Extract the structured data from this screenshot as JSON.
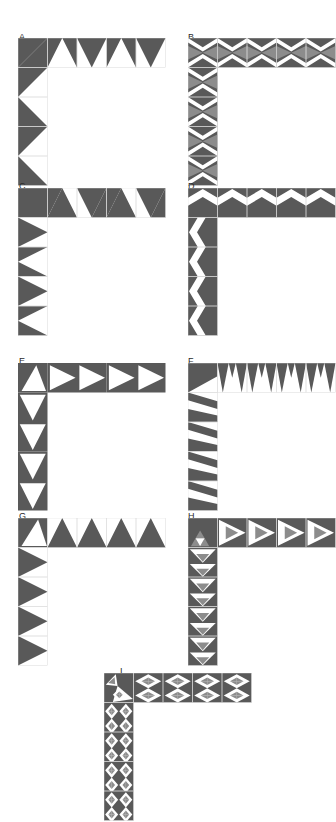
{
  "figure": {
    "type": "geometric-tiling-grid",
    "background_color": "#ffffff",
    "colors": {
      "dark": "#595959",
      "mid": "#8c8c8c",
      "white": "#ffffff",
      "grid_line": "#d9d9d9",
      "cell_line": "#595959",
      "label": "#2b2b2b"
    },
    "cell_size": 29.5,
    "shape": {
      "name": "L-elbow",
      "arm_horizontal_cells": 5,
      "arm_vertical_cells": 5,
      "thickness_cells": 1
    }
  },
  "panels": [
    {
      "id": "A",
      "label": "A",
      "label_x": 19,
      "label_y": 33,
      "art_x": 18,
      "art_y": 38,
      "cols": 5,
      "rows": 5,
      "cell": 29.5,
      "pattern": "half-square-triangles-alternating",
      "fill_primary": "#595959",
      "fill_secondary": "#ffffff",
      "grid_visible": true
    },
    {
      "id": "B",
      "label": "B",
      "label_x": 188,
      "label_y": 33,
      "art_x": 188,
      "art_y": 38,
      "cols": 5,
      "rows": 5,
      "cell": 29.5,
      "pattern": "two-tone-bowtie-with-white-zigzag-band",
      "fill_primary": "#595959",
      "fill_secondary": "#8c8c8c",
      "fill_band": "#ffffff",
      "grid_visible": true
    },
    {
      "id": "C",
      "label": "C",
      "label_x": 19,
      "label_y": 182,
      "art_x": 18,
      "art_y": 188,
      "cols": 5,
      "rows": 5,
      "cell": 29.5,
      "pattern": "zigzag-triangles-peaks",
      "fill_primary": "#595959",
      "fill_secondary": "#ffffff",
      "grid_visible": true
    },
    {
      "id": "D",
      "label": "D",
      "label_x": 188,
      "label_y": 182,
      "art_x": 188,
      "art_y": 188,
      "cols": 5,
      "rows": 5,
      "cell": 29.5,
      "pattern": "solid-dark-with-narrow-white-zigzag-stripe",
      "fill_primary": "#595959",
      "fill_secondary": "#ffffff",
      "grid_visible": true
    },
    {
      "id": "E",
      "label": "E",
      "label_x": 19,
      "label_y": 357,
      "art_x": 18,
      "art_y": 363,
      "cols": 5,
      "rows": 5,
      "cell": 29.5,
      "pattern": "inscribed-white-triangles-pointing-out",
      "fill_primary": "#595959",
      "fill_secondary": "#ffffff",
      "grid_visible": false
    },
    {
      "id": "F",
      "label": "F",
      "label_x": 188,
      "label_y": 357,
      "art_x": 188,
      "art_y": 363,
      "cols": 5,
      "rows": 5,
      "cell": 29.5,
      "pattern": "diagonal-sawtooth-bands",
      "fill_primary": "#595959",
      "fill_secondary": "#ffffff",
      "grid_visible": true
    },
    {
      "id": "G",
      "label": "G",
      "label_x": 19,
      "label_y": 512,
      "art_x": 18,
      "art_y": 518,
      "cols": 5,
      "rows": 5,
      "cell": 29.5,
      "pattern": "outward-pointing-dark-triangles-on-white",
      "fill_primary": "#595959",
      "fill_secondary": "#ffffff",
      "grid_visible": true
    },
    {
      "id": "H",
      "label": "H",
      "label_x": 188,
      "label_y": 512,
      "art_x": 188,
      "art_y": 518,
      "cols": 5,
      "rows": 5,
      "cell": 29.5,
      "pattern": "sierpinski-subdivided-triangles",
      "fill_primary": "#595959",
      "fill_secondary": "#8c8c8c",
      "fill_band": "#ffffff",
      "grid_visible": true
    },
    {
      "id": "I",
      "label": "I",
      "label_x": 120,
      "label_y": 667,
      "art_x": 104,
      "art_y": 673,
      "cols": 5,
      "rows": 5,
      "cell": 29.5,
      "pattern": "deep-recursive-triangle-subdivision",
      "fill_primary": "#595959",
      "fill_secondary": "#8c8c8c",
      "fill_band": "#ffffff",
      "grid_visible": true
    }
  ]
}
